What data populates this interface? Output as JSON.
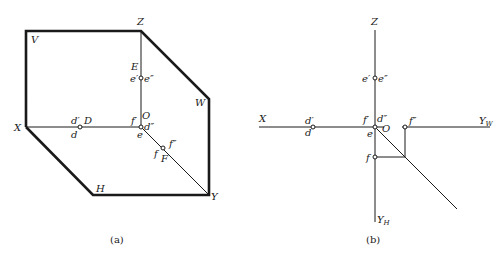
{
  "figure_a": {
    "caption": "(a)",
    "planes": {
      "V": "V",
      "W": "W",
      "H": "H"
    },
    "axes": {
      "X": "X",
      "Y": "Y",
      "Z": "Z",
      "O": "O"
    },
    "points": {
      "D": "D",
      "d_prime": "d′",
      "d": "d",
      "d_dprime": "d″",
      "E": "E",
      "e_prime": "e′",
      "e_dprime": "e″",
      "e": "e",
      "F": "F",
      "f_prime": "f′",
      "f": "f",
      "f_dprime": "f″"
    }
  },
  "figure_b": {
    "caption": "(b)",
    "axes": {
      "X": "X",
      "Z": "Z",
      "O": "O",
      "Y": "Y",
      "YW_sub": "W",
      "YH_sub": "H"
    },
    "points": {
      "d_prime": "d′",
      "d": "d",
      "d_dprime": "d″",
      "e_prime": "e′",
      "e_dprime": "e″",
      "e": "e",
      "f_prime": "f′",
      "f": "f",
      "f_dprime": "f″"
    }
  },
  "colors": {
    "line": "#1a1a1a",
    "background": "#ffffff"
  }
}
